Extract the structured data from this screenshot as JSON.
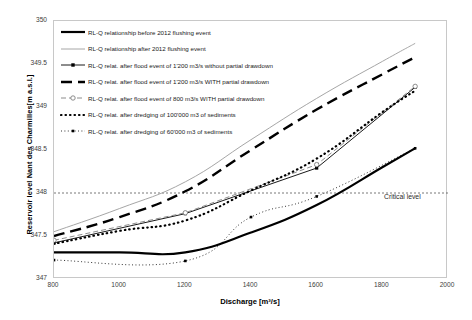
{
  "chart_data": {
    "type": "line",
    "title": "",
    "xlabel": "Discharge [m³/s]",
    "ylabel": "Reservoir level Nant des Charmilles[m a.s.l.]",
    "xlim": [
      800,
      2000
    ],
    "ylim": [
      347,
      350
    ],
    "xticks": [
      800,
      1000,
      1200,
      1400,
      1600,
      1800,
      2000
    ],
    "yticks": [
      347,
      347.5,
      348,
      348.5,
      349,
      349.5,
      350
    ],
    "grid": false,
    "legend_position": "top-left",
    "annotations": [
      {
        "text": "Critical level",
        "y": 348.0,
        "x": 1960,
        "style": "dotted-horizontal-line"
      }
    ],
    "series": [
      {
        "name": "RL-Q relationship before 2012 flushing event",
        "style": "solid",
        "color": "#000000",
        "width": 2.2,
        "marker": "none",
        "x": [
          800,
          1000,
          1200,
          1400,
          1600,
          1800,
          1900
        ],
        "y": [
          347.31,
          347.31,
          347.31,
          347.54,
          347.86,
          348.3,
          348.52
        ]
      },
      {
        "name": "RL-Q relationship after 2012 flushing event",
        "style": "solid",
        "color": "#a6a6a6",
        "width": 1.0,
        "marker": "none",
        "x": [
          800,
          1000,
          1200,
          1400,
          1600,
          1800,
          1900
        ],
        "y": [
          347.55,
          347.82,
          348.13,
          348.62,
          349.1,
          349.53,
          349.74
        ]
      },
      {
        "name": "RL-Q relat. after flood event of 1'200 m3/s without partial drawdown",
        "style": "solid-marker",
        "color": "#000000",
        "width": 0.9,
        "marker": "square",
        "x": [
          800,
          1200,
          1600,
          1900
        ],
        "y": [
          347.42,
          347.76,
          348.29,
          349.23
        ]
      },
      {
        "name": "RL-Q relat. after flood event of 1'200 m3/s WITH partial drawdown",
        "style": "dashed",
        "color": "#000000",
        "width": 2.4,
        "marker": "none",
        "x": [
          800,
          1000,
          1200,
          1400,
          1600,
          1800,
          1900
        ],
        "y": [
          347.5,
          347.72,
          348.02,
          348.5,
          348.97,
          349.38,
          349.58
        ]
      },
      {
        "name": "RL-Q relat. after flood event of 800 m3/s WITH partial drawdown",
        "style": "dash-marker-open",
        "color": "#808080",
        "width": 0.9,
        "marker": "circle",
        "x": [
          800,
          1200,
          1600,
          1900
        ],
        "y": [
          347.45,
          347.77,
          348.33,
          349.24
        ]
      },
      {
        "name": "RL-Q relat. after dredging of 100'000 m3 of sediments",
        "style": "dotted-thick",
        "color": "#000000",
        "width": 2.2,
        "marker": "none",
        "x": [
          800,
          1000,
          1200,
          1400,
          1600,
          1800,
          1900
        ],
        "y": [
          347.41,
          347.56,
          347.68,
          348.03,
          348.4,
          348.94,
          349.19
        ]
      },
      {
        "name": "RL-Q relat. after dredging of 60'000 m3 of sediments",
        "style": "dotted-thin-marker",
        "color": "#000000",
        "width": 0.8,
        "marker": "square-small",
        "x": [
          800,
          1200,
          1400,
          1600,
          1900
        ],
        "y": [
          347.22,
          347.21,
          347.72,
          347.96,
          348.52
        ]
      }
    ]
  },
  "legend": {
    "items": [
      {
        "label": "RL-Q relationship before 2012 flushing event"
      },
      {
        "label": "RL-Q relationship after 2012 flushing event"
      },
      {
        "label": "RL-Q relat. after flood event of 1'200 m3/s without partial drawdown"
      },
      {
        "label": "RL-Q relat. after flood event of 1'200 m3/s WITH partial drawdown"
      },
      {
        "label": "RL-Q relat. after flood event of 800 m3/s WITH partial drawdown"
      },
      {
        "label": "RL-Q relat. after dredging of 100'000 m3 of sediments"
      },
      {
        "label": "RL-Q relat. after dredging of 60'000 m3 of sediments"
      }
    ]
  },
  "axes": {
    "x_title": "Discharge [m³/s]",
    "y_title": "Reservoir level Nant des Charmilles[m a.s.l.]",
    "x_tick_labels": [
      "800",
      "1000",
      "1200",
      "1400",
      "1600",
      "1800",
      "2000"
    ],
    "y_tick_labels": [
      "347",
      "347.5",
      "348",
      "348.5",
      "349",
      "349.5",
      "350"
    ]
  },
  "annotation": {
    "critical_level": "Critical level"
  }
}
